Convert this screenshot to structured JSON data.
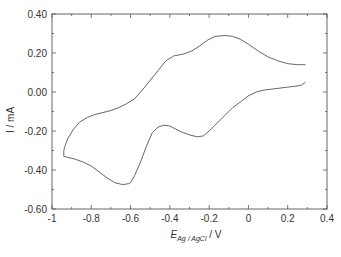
{
  "chart_data": {
    "type": "line",
    "title": "",
    "xlabel": "E_Ag/AgCl / V",
    "xlabel_main": "E",
    "xlabel_sub": "Ag / AgCl",
    "xlabel_unit": " / V",
    "ylabel": "I / mA",
    "xlim": [
      -1,
      0.4
    ],
    "ylim": [
      -0.6,
      0.4
    ],
    "x_ticks": [
      -1,
      -0.8,
      -0.6,
      -0.4,
      -0.2,
      0,
      0.2,
      0.4
    ],
    "x_tick_labels": [
      "-1",
      "-0.8",
      "-0.6",
      "-0.4",
      "-0.2",
      "0",
      "0.2",
      "0.4"
    ],
    "y_ticks": [
      0.4,
      0.2,
      0.0,
      -0.2,
      -0.4,
      -0.6
    ],
    "y_tick_labels": [
      "0.40",
      "0.20",
      "0.00",
      "-0.20",
      "-0.40",
      "-0.60"
    ],
    "grid": false,
    "legend": null,
    "series": [
      {
        "name": "cyclic voltammogram",
        "color": "#555555",
        "x": [
          0.29,
          0.25,
          0.2,
          0.15,
          0.1,
          0.05,
          0.0,
          -0.04,
          -0.08,
          -0.12,
          -0.17,
          -0.21,
          -0.25,
          -0.29,
          -0.33,
          -0.38,
          -0.42,
          -0.46,
          -0.5,
          -0.54,
          -0.58,
          -0.62,
          -0.66,
          -0.7,
          -0.74,
          -0.78,
          -0.82,
          -0.86,
          -0.89,
          -0.92,
          -0.935,
          -0.94,
          -0.94,
          -0.92,
          -0.88,
          -0.84,
          -0.8,
          -0.76,
          -0.72,
          -0.68,
          -0.64,
          -0.61,
          -0.6,
          -0.58,
          -0.55,
          -0.52,
          -0.49,
          -0.46,
          -0.43,
          -0.4,
          -0.37,
          -0.34,
          -0.3,
          -0.26,
          -0.23,
          -0.2,
          -0.16,
          -0.12,
          -0.08,
          -0.04,
          0.0,
          0.04,
          0.08,
          0.12,
          0.16,
          0.2,
          0.24,
          0.27,
          0.29
        ],
        "y": [
          0.14,
          0.14,
          0.145,
          0.16,
          0.18,
          0.21,
          0.245,
          0.27,
          0.285,
          0.29,
          0.285,
          0.265,
          0.235,
          0.21,
          0.195,
          0.185,
          0.16,
          0.11,
          0.06,
          0.01,
          -0.035,
          -0.06,
          -0.08,
          -0.095,
          -0.105,
          -0.115,
          -0.13,
          -0.155,
          -0.19,
          -0.24,
          -0.28,
          -0.3,
          -0.33,
          -0.335,
          -0.345,
          -0.36,
          -0.38,
          -0.41,
          -0.44,
          -0.465,
          -0.475,
          -0.47,
          -0.465,
          -0.43,
          -0.36,
          -0.28,
          -0.21,
          -0.18,
          -0.17,
          -0.175,
          -0.19,
          -0.205,
          -0.22,
          -0.23,
          -0.225,
          -0.2,
          -0.16,
          -0.12,
          -0.08,
          -0.05,
          -0.02,
          0.0,
          0.01,
          0.015,
          0.02,
          0.025,
          0.03,
          0.035,
          0.05
        ]
      }
    ],
    "annotations": [
      {
        "label": "anodic peak",
        "x": -0.12,
        "y": 0.29
      },
      {
        "label": "cathodic peak",
        "x": -0.6,
        "y": -0.475
      }
    ]
  }
}
